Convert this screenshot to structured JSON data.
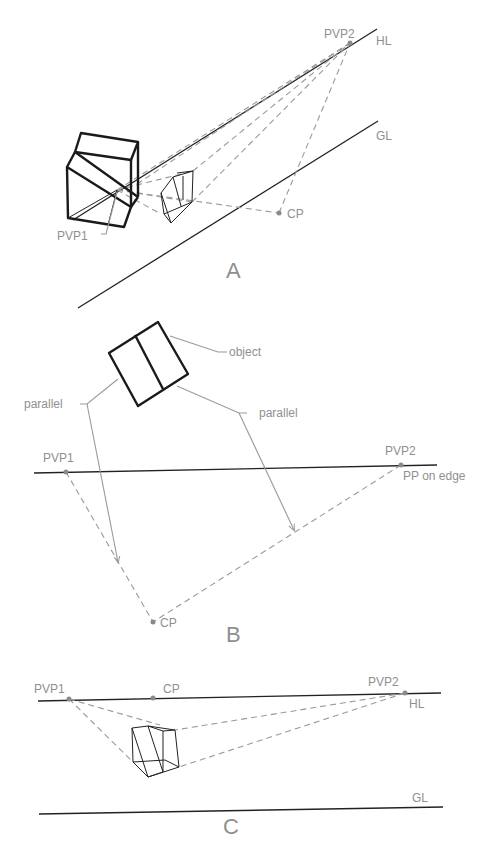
{
  "panels": {
    "a": {
      "caption": "A",
      "labels": {
        "pvp2": "PVP2",
        "hl": "HL",
        "gl": "GL",
        "cp": "CP",
        "pvp1": "PVP1"
      }
    },
    "b": {
      "caption": "B",
      "labels": {
        "object": "object",
        "parallel_left": "parallel",
        "parallel_right": "parallel",
        "pvp1": "PVP1",
        "pvp2": "PVP2",
        "pp": "PP on edge",
        "cp": "CP"
      }
    },
    "c": {
      "caption": "C",
      "labels": {
        "pvp1": "PVP1",
        "cp": "CP",
        "pvp2": "PVP2",
        "hl": "HL",
        "gl": "GL"
      }
    }
  },
  "colors": {
    "line": "#222222",
    "construction": "#9a9a9a",
    "label": "#8f8f8f",
    "background": "#ffffff"
  }
}
